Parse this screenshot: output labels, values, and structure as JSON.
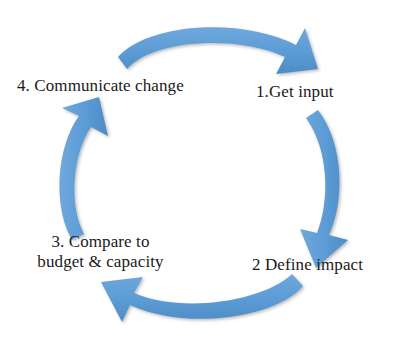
{
  "diagram": {
    "direction": "clockwise",
    "accent_color": "#5B9BD5",
    "text_color": "#1A1A1A",
    "background_color": "#FFFFFF",
    "steps": [
      {
        "id": "step1",
        "label": "1.Get input",
        "position": "top-right"
      },
      {
        "id": "step2",
        "label": "2 Define impact",
        "position": "bottom-right"
      },
      {
        "id": "step3",
        "label_line1": "3. Compare to",
        "label_line2": "budget & capacity",
        "position": "bottom-left"
      },
      {
        "id": "step4",
        "label": "4. Communicate change",
        "position": "top-left"
      }
    ],
    "arrows": [
      {
        "id": "arrow-top",
        "from": "step4",
        "to": "step1",
        "points": "right-down"
      },
      {
        "id": "arrow-right",
        "from": "step1",
        "to": "step2",
        "points": "down-left"
      },
      {
        "id": "arrow-bottom",
        "from": "step2",
        "to": "step3",
        "points": "left-up"
      },
      {
        "id": "arrow-left",
        "from": "step3",
        "to": "step4",
        "points": "up-right"
      }
    ]
  }
}
